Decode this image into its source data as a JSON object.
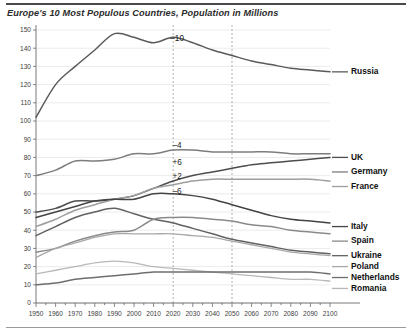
{
  "chart_title": "Europe's 10 Most Populous Countries, Population in Millions",
  "chart_data": {
    "type": "line",
    "title": "Europe's 10 Most Populous Countries, Population in Millions",
    "xlabel": "",
    "ylabel": "",
    "xlim": [
      1950,
      2100
    ],
    "ylim": [
      0,
      150
    ],
    "ytick_step": 10,
    "xtick_step": 10,
    "grid": true,
    "legend_position": "right",
    "yticks": [
      0,
      10,
      20,
      30,
      40,
      50,
      60,
      70,
      80,
      90,
      100,
      110,
      120,
      130,
      140,
      150
    ],
    "xticks": [
      1950,
      1960,
      1970,
      1980,
      1990,
      2000,
      2010,
      2020,
      2030,
      2040,
      2050,
      2060,
      2070,
      2080,
      2090,
      2100
    ],
    "x": [
      1950,
      1960,
      1970,
      1980,
      1990,
      2000,
      2010,
      2020,
      2030,
      2040,
      2050,
      2060,
      2070,
      2080,
      2090,
      2100
    ],
    "series": [
      {
        "name": "Russia",
        "color": "#5a5a5a",
        "width": 1.5,
        "values": [
          102,
          120,
          130,
          139,
          148,
          146,
          143,
          146,
          143,
          139,
          136,
          133,
          131,
          129,
          128,
          127
        ]
      },
      {
        "name": "Germany",
        "color": "#7d7d7d",
        "width": 1.5,
        "values": [
          70,
          73,
          78,
          78,
          79,
          82,
          82,
          84,
          84,
          83,
          83,
          83,
          83,
          82,
          82,
          82
        ]
      },
      {
        "name": "UK",
        "color": "#4d4d4d",
        "width": 1.5,
        "values": [
          50,
          52,
          56,
          56,
          57,
          59,
          63,
          67,
          70,
          72,
          74,
          76,
          77,
          78,
          79,
          80
        ]
      },
      {
        "name": "France",
        "color": "#9e9e9e",
        "width": 1.5,
        "values": [
          42,
          46,
          51,
          54,
          57,
          59,
          63,
          65,
          67,
          68,
          68,
          68,
          68,
          68,
          68,
          67
        ]
      },
      {
        "name": "Italy",
        "color": "#444444",
        "width": 1.5,
        "values": [
          47,
          50,
          53,
          56,
          57,
          57,
          60,
          60,
          59,
          57,
          54,
          51,
          48,
          46,
          45,
          44
        ]
      },
      {
        "name": "Ukraine",
        "color": "#616161",
        "width": 1.5,
        "values": [
          37,
          42,
          47,
          50,
          52,
          49,
          46,
          44,
          41,
          38,
          35,
          33,
          31,
          29,
          28,
          27
        ]
      },
      {
        "name": "Spain",
        "color": "#8a8a8a",
        "width": 1.5,
        "values": [
          28,
          30,
          34,
          37,
          39,
          40,
          46,
          47,
          47,
          46,
          45,
          43,
          42,
          40,
          39,
          38
        ]
      },
      {
        "name": "Poland",
        "color": "#a8a8a8",
        "width": 1.3,
        "values": [
          25,
          30,
          33,
          36,
          38,
          38,
          38,
          38,
          37,
          36,
          34,
          32,
          30,
          28,
          27,
          26
        ]
      },
      {
        "name": "Romania",
        "color": "#b8b8b8",
        "width": 1.3,
        "values": [
          16,
          18,
          20,
          22,
          23,
          22,
          20,
          19,
          18,
          17,
          16,
          15,
          14,
          13,
          13,
          12
        ]
      },
      {
        "name": "Netherlands",
        "color": "#6e6e6e",
        "width": 1.5,
        "values": [
          10,
          11,
          13,
          14,
          15,
          16,
          17,
          17,
          17,
          17,
          17,
          17,
          17,
          17,
          17,
          16
        ]
      }
    ],
    "annotations": [
      {
        "text": "–10",
        "x": 2022,
        "y": 144
      },
      {
        "text": "–4",
        "x": 2022,
        "y": 85
      },
      {
        "text": "+6",
        "x": 2022,
        "y": 76
      },
      {
        "text": "+2",
        "x": 2022,
        "y": 68
      },
      {
        "text": "–6",
        "x": 2022,
        "y": 60
      }
    ],
    "reference_lines": [
      {
        "x": 2020,
        "style": "dashed"
      },
      {
        "x": 2050,
        "style": "dashed"
      }
    ],
    "legend_entries": [
      {
        "label": "Russia",
        "y": 127,
        "color": "#5a5a5a"
      },
      {
        "label": "UK",
        "y": 80,
        "color": "#4d4d4d"
      },
      {
        "label": "Germany",
        "y": 72,
        "color": "#7d7d7d"
      },
      {
        "label": "France",
        "y": 64,
        "color": "#9e9e9e"
      },
      {
        "label": "Italy",
        "y": 42,
        "color": "#444444"
      },
      {
        "label": "Spain",
        "y": 34,
        "color": "#8a8a8a"
      },
      {
        "label": "Ukraine",
        "y": 26,
        "color": "#616161"
      },
      {
        "label": "Poland",
        "y": 20,
        "color": "#a8a8a8"
      },
      {
        "label": "Netherlands",
        "y": 14,
        "color": "#6e6e6e"
      },
      {
        "label": "Romania",
        "y": 8,
        "color": "#b8b8b8"
      }
    ]
  }
}
